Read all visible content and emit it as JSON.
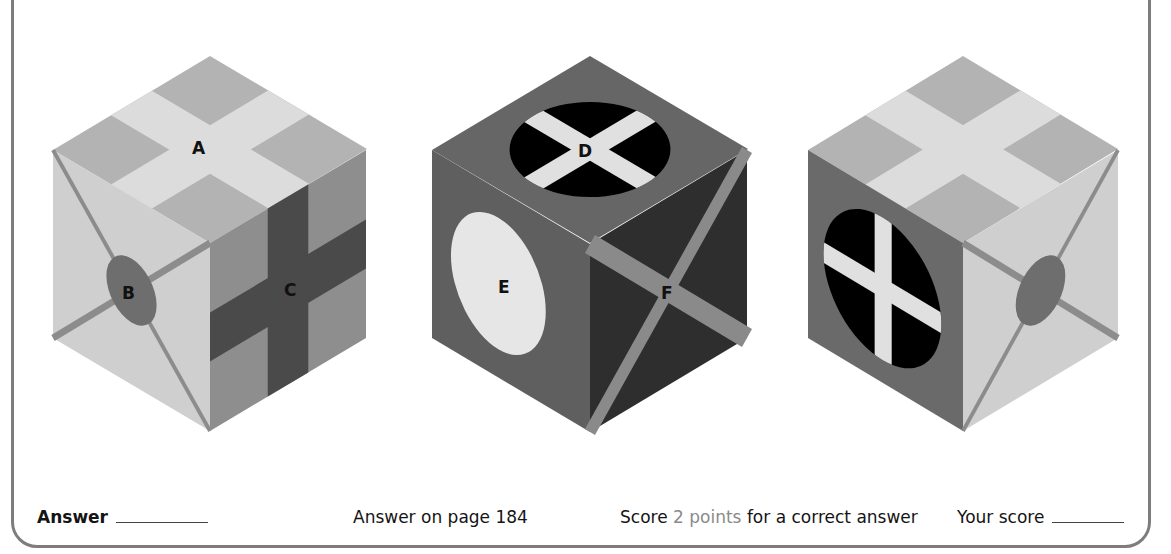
{
  "cubes": [
    {
      "id": "cube-1",
      "faces": {
        "top": {
          "label": "A",
          "pattern": "plus-cross",
          "base": "#b3b3b3",
          "mark": "#dcdcdc"
        },
        "left": {
          "label": "B",
          "pattern": "diagonal-x-with-ellipse",
          "base": "#cfcfcf",
          "lines": "#8c8c8c",
          "mark": "#6e6e6e"
        },
        "right": {
          "label": "C",
          "pattern": "plus-cross",
          "base": "#8e8e8e",
          "mark": "#4a4a4a"
        }
      }
    },
    {
      "id": "cube-2",
      "faces": {
        "top": {
          "label": "D",
          "pattern": "black-ellipse-with-white-x",
          "base": "#666666",
          "mark": "#000000",
          "lines": "#e0e0e0"
        },
        "left": {
          "label": "E",
          "pattern": "white-ellipse",
          "base": "#5f5f5f",
          "mark": "#e6e6e6"
        },
        "right": {
          "label": "F",
          "pattern": "diagonal-x",
          "base": "#2e2e2e",
          "lines": "#8a8a8a"
        }
      }
    },
    {
      "id": "cube-3",
      "faces": {
        "top": {
          "label": "",
          "pattern": "plus-cross",
          "base": "#b3b3b3",
          "mark": "#dcdcdc"
        },
        "left": {
          "label": "",
          "pattern": "black-ellipse-with-white-plus",
          "base": "#6a6a6a",
          "mark": "#000000",
          "lines": "#e0e0e0"
        },
        "right": {
          "label": "",
          "pattern": "diagonal-x-with-ellipse",
          "base": "#cfcfcf",
          "lines": "#8c8c8c",
          "mark": "#6e6e6e"
        }
      }
    }
  ],
  "labels": {
    "A": "A",
    "B": "B",
    "C": "C",
    "D": "D",
    "E": "E",
    "F": "F"
  },
  "footer": {
    "answer_label": "Answer",
    "page_ref": "Answer on page 184",
    "score_prefix": "Score",
    "score_points": "2 points",
    "score_suffix": "for a correct answer",
    "your_score_label": "Your score"
  },
  "colors": {
    "frame": "#7d7d7d",
    "points_text": "#8a8a8a"
  }
}
